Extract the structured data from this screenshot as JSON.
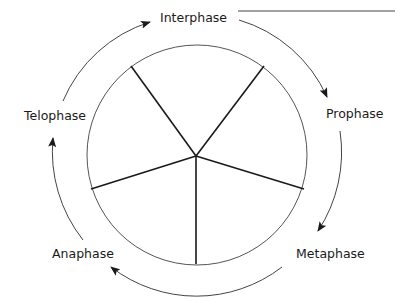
{
  "diagram": {
    "type": "cell-cycle",
    "phases": [
      {
        "id": "interphase",
        "label": "Interphase"
      },
      {
        "id": "prophase",
        "label": "Prophase"
      },
      {
        "id": "metaphase",
        "label": "Metaphase"
      },
      {
        "id": "anaphase",
        "label": "Anaphase"
      },
      {
        "id": "telophase",
        "label": "Telophase"
      }
    ],
    "cycle_direction": "clockwise",
    "inner_circle_segments": 5,
    "answer_line_blank": ""
  },
  "colors": {
    "line": "#444444",
    "spoke": "#1a1a1a",
    "text": "#1a1a1a",
    "background": "#ffffff"
  }
}
